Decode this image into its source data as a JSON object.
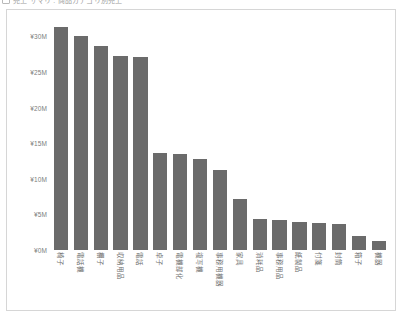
{
  "header": {
    "title": "売上 サマリ : 商品カテゴリ別売上",
    "icon": "panel-icon"
  },
  "chart_data": {
    "type": "bar",
    "title": "",
    "subtitle": "",
    "xlabel": "",
    "ylabel": "",
    "orientation": "vertical",
    "grid": false,
    "legend": null,
    "legend_position": "none",
    "bar_color": "#6b6b6b",
    "currency_symbol": "¥",
    "unit": "M",
    "ylim": [
      0,
      32
    ],
    "yticks": [
      0,
      5,
      10,
      15,
      20,
      25,
      30
    ],
    "ytick_labels": [
      "¥0M",
      "¥5M",
      "¥10M",
      "¥15M",
      "¥20M",
      "¥25M",
      "¥30M"
    ],
    "categories": [
      "椅子",
      "電話機",
      "棚子",
      "収納用品",
      "電話",
      "卓子",
      "電機部化",
      "複写機",
      "事務用機器",
      "家具",
      "消耗品",
      "事務用品",
      "紙製品",
      "付箋",
      "封筒",
      "箱子",
      "機器"
    ],
    "values": [
      31.3,
      30.0,
      28.6,
      27.3,
      27.1,
      13.6,
      13.5,
      12.8,
      11.2,
      7.2,
      4.3,
      4.2,
      4.0,
      3.8,
      3.6,
      1.9,
      1.3
    ]
  }
}
